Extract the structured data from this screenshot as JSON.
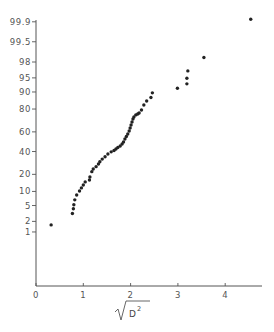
{
  "chart_data": {
    "type": "scatter",
    "title": "",
    "xlabel": "√D²",
    "ylabel": "",
    "y_scale": "normal-probability",
    "xlim": [
      0,
      4.6
    ],
    "ylim": [
      0.1,
      99.95
    ],
    "grid": false,
    "legend": null,
    "x_ticks": [
      0,
      1,
      2,
      3,
      4
    ],
    "x_tick_labels": [
      "0",
      "1",
      "2",
      "3",
      "4"
    ],
    "y_ticks": [
      1,
      2,
      5,
      10,
      20,
      40,
      60,
      80,
      90,
      95,
      98,
      99.5,
      99.9
    ],
    "y_tick_labels": [
      "1",
      "2",
      "5",
      "10",
      "20",
      "40",
      "60",
      "80",
      "90",
      "95",
      "98",
      "99.5",
      "99.9"
    ],
    "series": [
      {
        "name": "observations",
        "marker": "filled-circle",
        "color": "#222222",
        "points": [
          [
            0.32,
            1.6
          ],
          [
            0.77,
            3.2
          ],
          [
            0.79,
            4.2
          ],
          [
            0.8,
            5.2
          ],
          [
            0.82,
            6.7
          ],
          [
            0.86,
            8.5
          ],
          [
            0.92,
            10.2
          ],
          [
            0.96,
            11.7
          ],
          [
            1.0,
            13.2
          ],
          [
            1.04,
            15.0
          ],
          [
            1.13,
            16.2
          ],
          [
            1.14,
            18.1
          ],
          [
            1.18,
            22.0
          ],
          [
            1.21,
            24.1
          ],
          [
            1.27,
            26.0
          ],
          [
            1.32,
            28.3
          ],
          [
            1.35,
            30.3
          ],
          [
            1.4,
            32.7
          ],
          [
            1.46,
            34.9
          ],
          [
            1.52,
            37.5
          ],
          [
            1.59,
            39.7
          ],
          [
            1.65,
            41.0
          ],
          [
            1.69,
            42.5
          ],
          [
            1.73,
            44.0
          ],
          [
            1.78,
            45.6
          ],
          [
            1.82,
            47.6
          ],
          [
            1.85,
            49.7
          ],
          [
            1.88,
            52.8
          ],
          [
            1.91,
            55.3
          ],
          [
            1.94,
            57.9
          ],
          [
            1.97,
            60.9
          ],
          [
            1.99,
            63.8
          ],
          [
            2.01,
            66.7
          ],
          [
            2.03,
            69.4
          ],
          [
            2.05,
            72.1
          ],
          [
            2.07,
            73.8
          ],
          [
            2.11,
            75.5
          ],
          [
            2.15,
            76.2
          ],
          [
            2.18,
            77.0
          ],
          [
            2.23,
            79.3
          ],
          [
            2.28,
            82.8
          ],
          [
            2.34,
            85.3
          ],
          [
            2.43,
            87.3
          ],
          [
            2.46,
            89.6
          ],
          [
            2.99,
            91.6
          ],
          [
            3.19,
            93.2
          ],
          [
            3.19,
            94.9
          ],
          [
            3.21,
            96.6
          ],
          [
            3.55,
            98.5
          ],
          [
            4.54,
            99.92
          ]
        ]
      }
    ]
  },
  "layout": {
    "x_origin_px": 36,
    "x_unit_px": 47.3,
    "x_axis_y_px": 286,
    "x_axis_end_px": 262,
    "y_axis_top_px": 20,
    "y_z0_px": 141.7,
    "y_px_per_z": 38.8
  }
}
